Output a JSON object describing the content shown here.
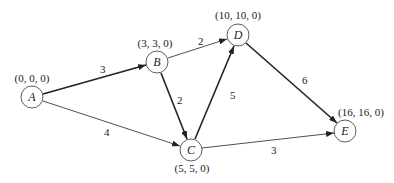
{
  "diagram": {
    "type": "directed-weighted-graph",
    "nodes": [
      {
        "id": "A",
        "label": "A",
        "annotation": "(0, 0, 0)",
        "x": 32,
        "y": 97
      },
      {
        "id": "B",
        "label": "B",
        "annotation": "(3, 3, 0)",
        "x": 157,
        "y": 62
      },
      {
        "id": "C",
        "label": "C",
        "annotation": "(5, 5, 0)",
        "x": 191,
        "y": 150
      },
      {
        "id": "D",
        "label": "D",
        "annotation": "(10, 10, 0)",
        "x": 238,
        "y": 35
      },
      {
        "id": "E",
        "label": "E",
        "annotation": "(16, 16, 0)",
        "x": 345,
        "y": 131
      }
    ],
    "edges": [
      {
        "from": "A",
        "to": "B",
        "weight": "3",
        "bold": true
      },
      {
        "from": "A",
        "to": "C",
        "weight": "4",
        "bold": false
      },
      {
        "from": "B",
        "to": "D",
        "weight": "2",
        "bold": false
      },
      {
        "from": "B",
        "to": "C",
        "weight": "2",
        "bold": true
      },
      {
        "from": "C",
        "to": "D",
        "weight": "5",
        "bold": true
      },
      {
        "from": "D",
        "to": "E",
        "weight": "6",
        "bold": true
      },
      {
        "from": "C",
        "to": "E",
        "weight": "3",
        "bold": false
      }
    ]
  }
}
